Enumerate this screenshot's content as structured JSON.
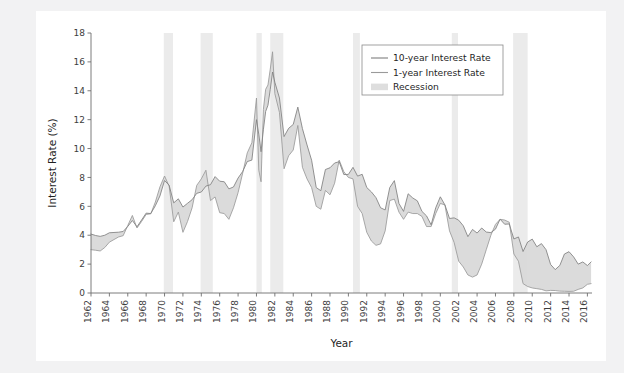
{
  "figure": {
    "background": "#ffffff",
    "page_background": "#f2f2f3"
  },
  "chart_data": {
    "type": "line",
    "title": "",
    "xlabel": "Year",
    "ylabel": "Interest Rate (%)",
    "xlim": [
      1962,
      2016.5
    ],
    "ylim": [
      0,
      18
    ],
    "grid": false,
    "legend_position": "top-right",
    "colors": {
      "ten_year_line": "#7f7f7f",
      "one_year_line": "#9a9a9a",
      "spread_fill": "#d9d9d9",
      "recession_band": "#ebebeb",
      "axis": "#6e6e6e",
      "text": "#1f1f1f"
    },
    "xticks": [
      1962,
      1964,
      1966,
      1968,
      1970,
      1972,
      1974,
      1976,
      1978,
      1980,
      1982,
      1984,
      1986,
      1988,
      1990,
      1992,
      1994,
      1996,
      1998,
      2000,
      2002,
      2004,
      2006,
      2008,
      2010,
      2012,
      2014,
      2016
    ],
    "xticklabels": [
      "1962",
      "1964",
      "1966",
      "1968",
      "1970",
      "1972",
      "1974",
      "1976",
      "1978",
      "1980",
      "1982",
      "1984",
      "1986",
      "1988",
      "1990",
      "1992",
      "1994",
      "1996",
      "1998",
      "2000",
      "2002",
      "2004",
      "2006",
      "2008",
      "2010",
      "2012",
      "2014",
      "2016"
    ],
    "yticks": [
      0,
      2,
      4,
      6,
      8,
      10,
      12,
      14,
      16,
      18
    ],
    "yticklabels": [
      "0",
      "2",
      "4",
      "6",
      "8",
      "10",
      "12",
      "14",
      "16",
      "18"
    ],
    "legend": [
      {
        "label": "10-year Interest Rate",
        "marker": "line",
        "color": "#7f7f7f"
      },
      {
        "label": "1-year Interest Rate",
        "marker": "line",
        "color": "#9a9a9a"
      },
      {
        "label": "Recession",
        "marker": "patch",
        "color": "#dedede"
      }
    ],
    "recessions": [
      {
        "start": 1969.92,
        "end": 1970.92
      },
      {
        "start": 1973.92,
        "end": 1975.25
      },
      {
        "start": 1980.0,
        "end": 1980.58
      },
      {
        "start": 1981.5,
        "end": 1982.92
      },
      {
        "start": 1990.5,
        "end": 1991.25
      },
      {
        "start": 2001.25,
        "end": 2001.92
      },
      {
        "start": 2007.92,
        "end": 2009.5
      }
    ],
    "x": [
      1962.0,
      1962.5,
      1963.0,
      1963.5,
      1964.0,
      1964.5,
      1965.0,
      1965.5,
      1966.0,
      1966.5,
      1967.0,
      1967.5,
      1968.0,
      1968.5,
      1969.0,
      1969.5,
      1970.0,
      1970.5,
      1971.0,
      1971.5,
      1972.0,
      1972.5,
      1973.0,
      1973.5,
      1974.0,
      1974.5,
      1975.0,
      1975.5,
      1976.0,
      1976.5,
      1977.0,
      1977.5,
      1978.0,
      1978.5,
      1979.0,
      1979.5,
      1980.0,
      1980.25,
      1980.5,
      1980.75,
      1981.0,
      1981.25,
      1981.5,
      1981.75,
      1982.0,
      1982.5,
      1983.0,
      1983.5,
      1984.0,
      1984.5,
      1985.0,
      1985.5,
      1986.0,
      1986.5,
      1987.0,
      1987.5,
      1988.0,
      1988.5,
      1989.0,
      1989.5,
      1990.0,
      1990.5,
      1991.0,
      1991.5,
      1992.0,
      1992.5,
      1993.0,
      1993.5,
      1994.0,
      1994.5,
      1995.0,
      1995.5,
      1996.0,
      1996.5,
      1997.0,
      1997.5,
      1998.0,
      1998.5,
      1999.0,
      1999.5,
      2000.0,
      2000.5,
      2001.0,
      2001.5,
      2002.0,
      2002.5,
      2003.0,
      2003.5,
      2004.0,
      2004.5,
      2005.0,
      2005.5,
      2006.0,
      2006.5,
      2007.0,
      2007.5,
      2008.0,
      2008.5,
      2009.0,
      2009.5,
      2010.0,
      2010.5,
      2011.0,
      2011.5,
      2012.0,
      2012.5,
      2013.0,
      2013.5,
      2014.0,
      2014.5,
      2015.0,
      2015.5,
      2016.0,
      2016.4
    ],
    "series": [
      {
        "name": "10-year Interest Rate",
        "values": [
          4.08,
          3.98,
          3.92,
          4.0,
          4.17,
          4.19,
          4.21,
          4.26,
          4.61,
          5.02,
          4.58,
          5.05,
          5.53,
          5.5,
          6.04,
          6.72,
          7.79,
          7.46,
          6.24,
          6.52,
          5.95,
          6.21,
          6.46,
          6.9,
          6.99,
          7.4,
          7.5,
          8.06,
          7.74,
          7.7,
          7.21,
          7.34,
          7.96,
          8.41,
          9.1,
          9.2,
          12.0,
          11.0,
          9.78,
          11.3,
          12.57,
          13.0,
          14.1,
          15.3,
          14.59,
          13.5,
          10.83,
          11.4,
          11.67,
          12.87,
          11.38,
          10.25,
          9.19,
          7.3,
          7.08,
          8.55,
          8.67,
          9.0,
          9.09,
          8.2,
          8.21,
          8.7,
          8.09,
          8.22,
          7.3,
          7.0,
          6.6,
          5.9,
          5.75,
          7.3,
          7.78,
          6.2,
          5.65,
          6.87,
          6.58,
          6.38,
          5.65,
          5.34,
          4.72,
          5.9,
          6.66,
          6.1,
          5.16,
          5.2,
          5.04,
          4.65,
          3.9,
          4.4,
          4.15,
          4.5,
          4.22,
          4.18,
          4.42,
          5.11,
          4.76,
          4.78,
          3.74,
          3.88,
          2.87,
          3.53,
          3.73,
          3.2,
          3.42,
          3.0,
          1.97,
          1.62,
          1.91,
          2.7,
          2.86,
          2.5,
          2.0,
          2.15,
          1.9,
          2.15
        ]
      },
      {
        "name": "1-year Interest Rate",
        "values": [
          3.0,
          2.96,
          2.91,
          3.15,
          3.52,
          3.7,
          3.88,
          3.97,
          4.67,
          5.37,
          4.5,
          4.95,
          5.44,
          5.48,
          6.3,
          7.35,
          8.1,
          7.4,
          4.93,
          5.6,
          4.2,
          4.95,
          5.9,
          7.45,
          7.9,
          8.5,
          6.4,
          6.65,
          5.56,
          5.5,
          5.1,
          5.9,
          6.95,
          8.3,
          9.7,
          10.4,
          13.5,
          8.5,
          7.7,
          12.7,
          14.1,
          14.4,
          15.5,
          16.7,
          13.8,
          12.5,
          8.6,
          9.5,
          9.9,
          11.6,
          8.7,
          7.9,
          7.3,
          6.0,
          5.8,
          7.1,
          6.8,
          7.6,
          9.2,
          8.4,
          8.0,
          7.9,
          6.0,
          5.5,
          4.2,
          3.6,
          3.3,
          3.4,
          4.3,
          6.4,
          6.5,
          5.6,
          5.1,
          5.6,
          5.5,
          5.5,
          5.3,
          4.6,
          4.6,
          5.5,
          6.2,
          6.1,
          4.3,
          3.5,
          2.2,
          1.8,
          1.25,
          1.1,
          1.25,
          2.0,
          3.0,
          4.0,
          4.75,
          5.1,
          5.05,
          4.9,
          2.7,
          2.2,
          0.65,
          0.45,
          0.35,
          0.3,
          0.25,
          0.15,
          0.18,
          0.17,
          0.13,
          0.12,
          0.11,
          0.12,
          0.25,
          0.35,
          0.6,
          0.65
        ]
      }
    ]
  }
}
